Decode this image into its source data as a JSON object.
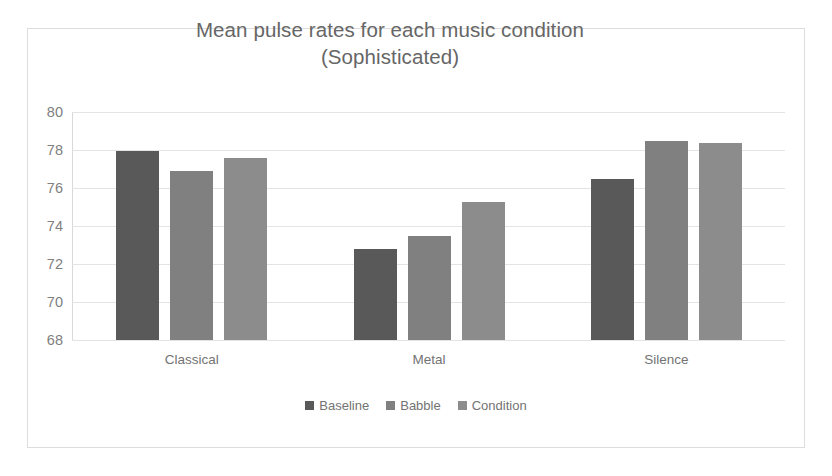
{
  "figure": {
    "border_color": "#dddddd",
    "background": "#ffffff",
    "title_line_1": "Mean pulse rates for each music condition",
    "title_line_2": "(Sophisticated)"
  },
  "chart_data": {
    "type": "bar",
    "title": "Mean pulse rates for each music condition (Sophisticated)",
    "xlabel": "",
    "ylabel": "",
    "ylim": [
      68,
      80
    ],
    "yticks": [
      68,
      70,
      72,
      74,
      76,
      78,
      80
    ],
    "ytick_labels": [
      "68",
      "70",
      "72",
      "74",
      "76",
      "78",
      "80"
    ],
    "grid": true,
    "legend_position": "bottom",
    "categories": [
      "Classical",
      "Metal",
      "Silence"
    ],
    "series": [
      {
        "name": "Baseline",
        "color": "#595959",
        "values": [
          77.95,
          72.8,
          76.5
        ]
      },
      {
        "name": "Babble",
        "color": "#808080",
        "values": [
          76.9,
          73.5,
          78.45
        ]
      },
      {
        "name": "Condition",
        "color": "#8c8c8c",
        "values": [
          77.6,
          75.25,
          78.35
        ]
      }
    ]
  }
}
